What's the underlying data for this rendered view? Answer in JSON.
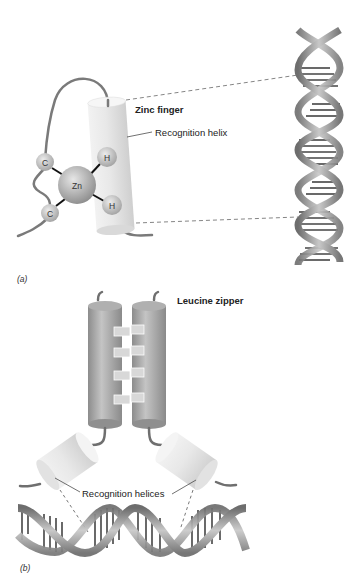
{
  "panel_a": {
    "panel_label": "(a)",
    "title": "Zinc finger",
    "helix_label": "Recognition helix",
    "atoms": {
      "cys_top": "C",
      "cys_bottom": "C",
      "zinc": "Zn",
      "his_top": "H",
      "his_bottom": "H"
    },
    "dna_orientation": "vertical"
  },
  "panel_b": {
    "panel_label": "(b)",
    "title": "Leucine zipper",
    "helices_label": "Recognition helices",
    "dna_orientation": "horizontal"
  },
  "colors": {
    "background": "#ffffff",
    "cylinder_light": "#e6e6e6",
    "cylinder_dark": "#9a9a9a",
    "strand": "#7a7a7a",
    "dna": "#8a8a8a",
    "text": "#222222"
  }
}
